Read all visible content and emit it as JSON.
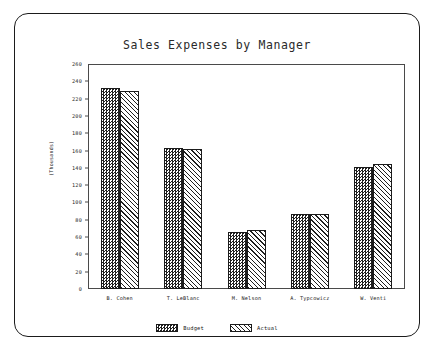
{
  "chart_data": {
    "type": "bar",
    "title": "Sales Expenses by Manager",
    "xlabel": "",
    "ylabel": "(Thousands)",
    "ylim": [
      0,
      260
    ],
    "ytick_step": 20,
    "yticks": [
      0,
      20,
      40,
      60,
      80,
      100,
      120,
      140,
      160,
      180,
      200,
      220,
      240,
      260
    ],
    "grid": false,
    "legend_position": "bottom",
    "categories": [
      "B. Cohen",
      "T. LeBlanc",
      "M. Nelson",
      "A. Typcowicz",
      "W. Venti"
    ],
    "series": [
      {
        "name": "Budget",
        "values": [
          232,
          163,
          66,
          87,
          141
        ]
      },
      {
        "name": "Actual",
        "values": [
          229,
          162,
          68,
          87,
          144
        ]
      }
    ]
  }
}
